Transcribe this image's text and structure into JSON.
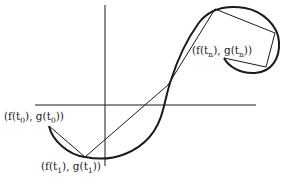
{
  "diagram": {
    "type": "parametric-curve-polygonal-approximation",
    "colors": {
      "background": "#ffffff",
      "stroke": "#1a1a1a",
      "text": "#222222"
    },
    "labels": {
      "start": {
        "prefix": "(f(t",
        "sub1": "0",
        "mid": "), g(t",
        "sub2": "0",
        "suffix": "))"
      },
      "second": {
        "prefix": "(f(t",
        "sub1": "1",
        "mid": "), g(t",
        "sub2": "1",
        "suffix": "))"
      },
      "end": {
        "prefix": "(f(t",
        "sub1": "n",
        "mid": "), g(t",
        "sub2": "n",
        "suffix": "))"
      }
    },
    "axes": {
      "x_axis": {
        "x1": 35,
        "y1": 105,
        "x2": 256,
        "y2": 105
      },
      "y_axis": {
        "x1": 105,
        "y1": 5,
        "x2": 105,
        "y2": 166
      }
    },
    "polygon_points": "49,126 85,157 168,85 215,9 275,33 266,67 224,58"
  }
}
